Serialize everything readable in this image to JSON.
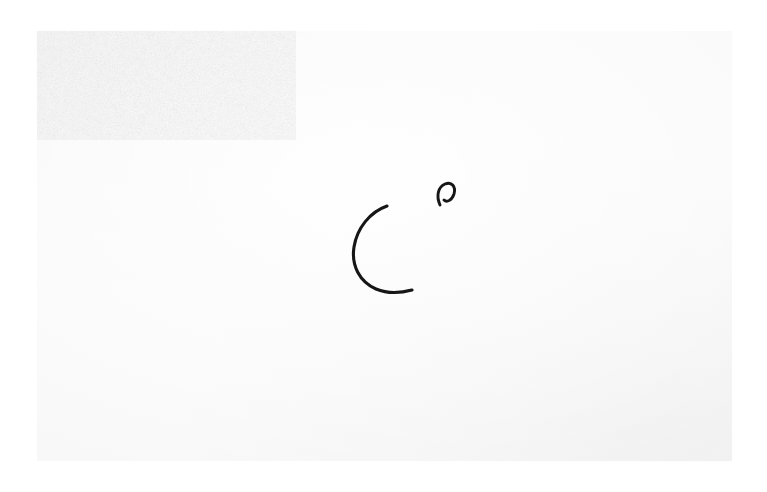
{
  "image": {
    "kind": "photograph-of-ink-drawing",
    "width": 767,
    "height": 492,
    "caption": "Two small black ink pen strokes drawn on a sheet of textured white watercolour paper",
    "background_color": "#ffffff"
  },
  "paper": {
    "name": "textured watercolour paper sheet",
    "base_color": "#f6f6f6",
    "highlight_color": "#ffffff",
    "shadow_color": "#e2e2e2",
    "left": 36,
    "top": 30,
    "width": 697,
    "height": 432,
    "texture": "cold-press paper grain"
  },
  "artwork": {
    "name": "ink-drawing",
    "ink_color": "#141414",
    "stroke_count": 2,
    "strokes": [
      {
        "name": "large-c-curve",
        "description": "large open C-shaped arc opening to the right, tapered at both ends",
        "bbox": {
          "x": 352,
          "y": 204,
          "width": 62,
          "height": 89
        },
        "path": "M 387 206 C 370 212, 357 228, 354 247 C 351 266, 360 282, 376 289 C 388 294, 401 293, 412 290",
        "stroke_width": 3.1
      },
      {
        "name": "small-hook-mark",
        "description": "small arch mark, like a tiny inverted u whose right leg curls inward",
        "bbox": {
          "x": 436,
          "y": 182,
          "width": 19,
          "height": 25
        },
        "path": "M 440 205 C 436 196, 438 187, 445 184 C 452 181, 456 187, 454 194 C 452 200, 447 203, 444 200",
        "stroke_width": 2.9
      }
    ]
  }
}
